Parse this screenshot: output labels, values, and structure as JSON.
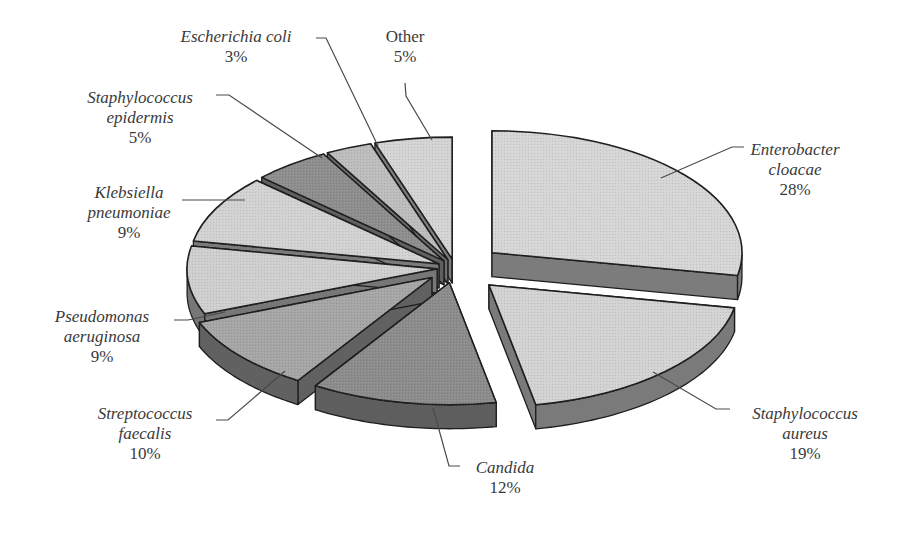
{
  "chart_data": {
    "type": "pie",
    "style": "3d-exploded",
    "title": "",
    "categories": [
      "Enterobacter cloacae",
      "Staphylococcus aureus",
      "Candida",
      "Streptococcus faecalis",
      "Pseudomonas aeruginosa",
      "Klebsiella pneumoniae",
      "Staphylococcus epidermis",
      "Escherichia coli",
      "Other"
    ],
    "values": [
      28,
      19,
      12,
      10,
      9,
      9,
      5,
      3,
      5
    ],
    "unit": "%",
    "legend": "none (labels with leader lines)",
    "slices": [
      {
        "name": "Enterobacter cloacae",
        "line1": "Enterobacter",
        "line2": "cloacae",
        "pct": "28%",
        "value": 28,
        "italic": true,
        "top": "#d6d6d6",
        "side": "#7c7c7c",
        "explode": 48,
        "lx": 795,
        "ly": 140
      },
      {
        "name": "Staphylococcus aureus",
        "line1": "Staphylococcus",
        "line2": "aureus",
        "pct": "19%",
        "value": 19,
        "italic": true,
        "top": "#d3d3d3",
        "side": "#7a7a7a",
        "explode": 48,
        "lx": 805,
        "ly": 404
      },
      {
        "name": "Candida",
        "line1": "Candida",
        "line2": "",
        "pct": "12%",
        "value": 12,
        "italic": true,
        "top": "#8c8c8c",
        "side": "#5e5e5e",
        "explode": 30,
        "lx": 505,
        "ly": 458
      },
      {
        "name": "Streptococcus faecalis",
        "line1": "Streptococcus",
        "line2": "faecalis",
        "pct": "10%",
        "value": 10,
        "italic": true,
        "top": "#a6a6a6",
        "side": "#616161",
        "explode": 30,
        "lx": 145,
        "ly": 404
      },
      {
        "name": "Pseudomonas aeruginosa",
        "line1": "Pseudomonas",
        "line2": "aeruginosa",
        "pct": "9%",
        "value": 9,
        "italic": true,
        "top": "#cfcfcf",
        "side": "#777777",
        "explode": 18,
        "lx": 102,
        "ly": 307
      },
      {
        "name": "Klebsiella pneumoniae",
        "line1": "Klebsiella",
        "line2": "pneumoniae",
        "pct": "9%",
        "value": 9,
        "italic": true,
        "top": "#d2d2d2",
        "side": "#7b7b7b",
        "explode": 18,
        "lx": 129,
        "ly": 183
      },
      {
        "name": "Staphylococcus epidermis",
        "line1": "Staphylococcus",
        "line2": "epidermis",
        "pct": "5%",
        "value": 5,
        "italic": true,
        "top": "#8e8e8e",
        "side": "#5f5f5f",
        "explode": 18,
        "lx": 140,
        "ly": 88
      },
      {
        "name": "Escherichia coli",
        "line1": "Escherichia coli",
        "line2": "",
        "pct": "3%",
        "value": 3,
        "italic": true,
        "top": "#bdbdbd",
        "side": "#6f6f6f",
        "explode": 18,
        "lx": 236,
        "ly": 27
      },
      {
        "name": "Other",
        "line1": "Other",
        "line2": "",
        "pct": "5%",
        "value": 5,
        "italic": false,
        "top": "#d4d4d4",
        "side": "#7d7d7d",
        "explode": 18,
        "lx": 405,
        "ly": 27
      }
    ],
    "geometry": {
      "cx": 455,
      "cy": 268,
      "rx": 250,
      "ry": 122,
      "depth": 24,
      "start_deg": -90
    },
    "leader_lines": [
      {
        "slice": "Enterobacter cloacae",
        "points": [
          [
            661,
            178
          ],
          [
            732,
            147
          ],
          [
            744,
            147
          ]
        ]
      },
      {
        "slice": "Staphylococcus aureus",
        "points": [
          [
            653,
            372
          ],
          [
            716,
            409
          ],
          [
            730,
            409
          ]
        ]
      },
      {
        "slice": "Candida",
        "points": [
          [
            433,
            408
          ],
          [
            449,
            466
          ],
          [
            460,
            466
          ]
        ]
      },
      {
        "slice": "Streptococcus faecalis",
        "points": [
          [
            285,
            371
          ],
          [
            228,
            420
          ],
          [
            216,
            420
          ]
        ]
      },
      {
        "slice": "Pseudomonas aeruginosa",
        "points": [
          [
            225,
            312
          ],
          [
            188,
            320
          ],
          [
            174,
            320
          ]
        ]
      },
      {
        "slice": "Klebsiella pneumoniae",
        "points": [
          [
            245,
            200
          ],
          [
            182,
            200
          ]
        ]
      },
      {
        "slice": "Staphylococcus epidermis",
        "points": [
          [
            322,
            158
          ],
          [
            229,
            95
          ],
          [
            216,
            95
          ]
        ]
      },
      {
        "slice": "Escherichia coli",
        "points": [
          [
            378,
            146
          ],
          [
            326,
            38
          ],
          [
            316,
            38
          ]
        ]
      },
      {
        "slice": "Other",
        "points": [
          [
            432,
            140
          ],
          [
            406,
            96
          ],
          [
            405,
            83
          ]
        ]
      }
    ]
  }
}
